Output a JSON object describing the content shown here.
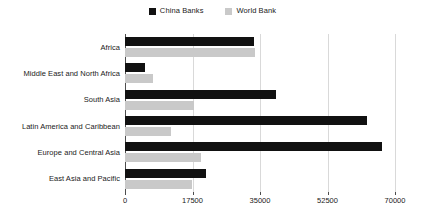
{
  "chart_data": {
    "type": "bar",
    "orientation": "horizontal",
    "title": "",
    "subtitle": "",
    "xlabel": "",
    "ylabel": "",
    "xlim": [
      0,
      70000
    ],
    "ylim": null,
    "grid": true,
    "grid_axis": "x",
    "legend_position": "top-center",
    "categories": [
      "Africa",
      "Middle East and North Africa",
      "South Asia",
      "Latin America and Caribbean",
      "Europe and Central Asia",
      "East Asia and Pacific"
    ],
    "series": [
      {
        "name": "China Banks",
        "color": "#111111",
        "values": [
          33400,
          5200,
          39100,
          62700,
          66600,
          21000
        ]
      },
      {
        "name": "World Bank",
        "color": "#c9c9c9",
        "values": [
          33700,
          7300,
          17900,
          11900,
          19700,
          17400
        ]
      }
    ],
    "x_ticks": [
      0,
      17500,
      35000,
      52500,
      70000
    ],
    "x_tick_labels": [
      "0",
      "17500",
      "35000",
      "52500",
      "70000"
    ]
  },
  "legend": {
    "items": [
      {
        "label": "China Banks",
        "color": "#111111"
      },
      {
        "label": "World Bank",
        "color": "#c9c9c9"
      }
    ]
  },
  "colors": {
    "china_banks": "#111111",
    "world_bank": "#c9c9c9",
    "gridline": "#d9d9d9",
    "axis": "#4d4d4d",
    "text": "#1a1a1a",
    "background": "#ffffff"
  }
}
